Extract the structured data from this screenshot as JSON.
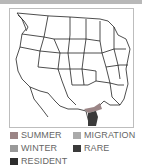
{
  "map": {
    "region": "United States (lower 48) with northern Mexico",
    "highlight_region": "South Texas / northeastern Mexico"
  },
  "legend": {
    "items": [
      {
        "key": "summer",
        "label": "SUMMER",
        "color": "#9b8586"
      },
      {
        "key": "migration",
        "label": "MIGRATION",
        "color": "#aaaaaa"
      },
      {
        "key": "winter",
        "label": "WINTER",
        "color": "#999999"
      },
      {
        "key": "rare",
        "label": "RARE",
        "color": "#3a3a3a"
      },
      {
        "key": "resident",
        "label": "RESIDENT",
        "color": "#2d2d2d"
      }
    ]
  }
}
